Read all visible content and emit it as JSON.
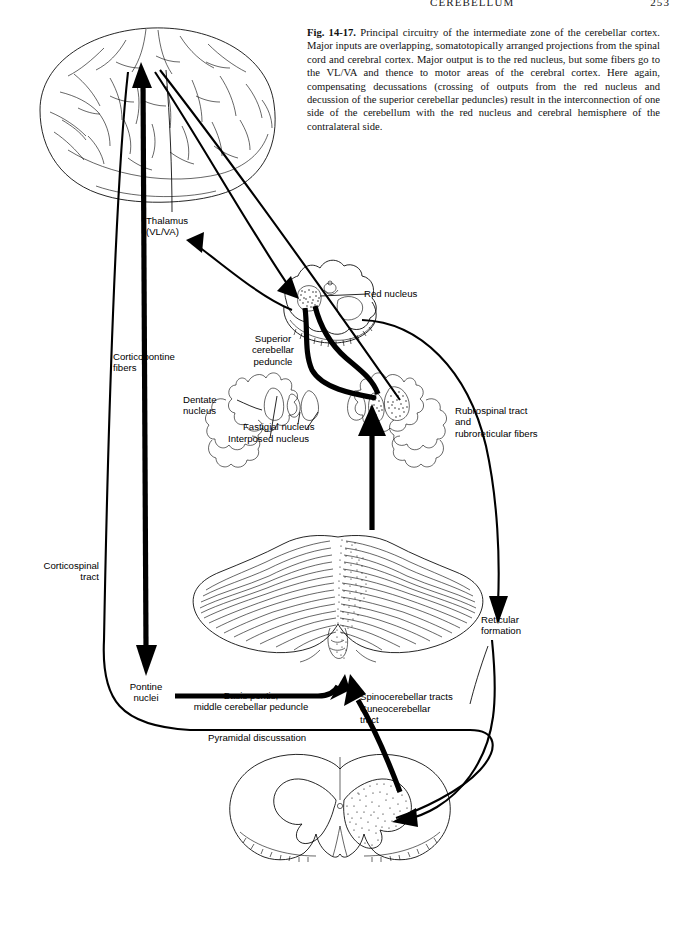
{
  "page": {
    "running_head_title": "CEREBELLUM",
    "page_number": "253"
  },
  "caption": {
    "figure_number": "Fig. 14-17.",
    "text": " Principal circuitry of the intermediate zone of the cerebellar cortex. Major inputs are overlapping, somatotopically arranged projections from the spinal cord and cerebral cortex. Major output is to the red nucleus, but some fibers go to the VL/VA and thence to motor areas of the cerebral cortex. Here again, compensating decussations (crossing of outputs from the red nucleus and decussion of the superior cerebellar peduncles) result in the interconnection of one side of the cerebellum with the red nucleus and cerebral hemisphere of the contralateral side."
  },
  "labels": {
    "thalamus": "Thalamus\n(VL/VA)",
    "red_nucleus": "Red nucleus",
    "corticopontine": "Corticopontine\nfibers",
    "superior_peduncle": "Superior\ncerebellar\npeduncle",
    "dentate": "Dentate\nnucleus",
    "fastigial": "Fastigial nucleus",
    "interposed": "Interposed nucleus",
    "rubrospinal": "Rubrospinal tract\nand\nrubroreticular fibers",
    "corticospinal": "Corticospinal\ntract",
    "reticular": "Reticular\nformation",
    "pontine_nuclei": "Pontine\nnuclei",
    "basis_pontis": "Basis pontis,\nmiddle cerebellar peduncle",
    "spinocerebellar": "Spinocerebellar tracts",
    "cuneocerebellar": "Cuneocerebellar\ntract",
    "pyramidal": "Pyramidal discussation"
  },
  "structures": {
    "cerebral_hemisphere": "cerebral-hemisphere",
    "midbrain": "midbrain-cross-section",
    "cerebellum_nuclei": "cerebellar-deep-nuclei-section",
    "cerebellum": "cerebellum-dorsal-view",
    "spinal_cord": "spinal-cord-cross-section"
  },
  "colors": {
    "ink": "#000000",
    "paper": "#ffffff"
  }
}
